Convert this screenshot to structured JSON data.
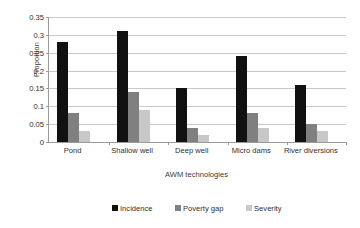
{
  "chart_data": {
    "type": "bar",
    "title": "",
    "xlabel": "AWM technologies",
    "ylabel": "Proportion",
    "categories": [
      "Pond",
      "Shallow well",
      "Deep well",
      "Micro dams",
      "River diversions"
    ],
    "series": [
      {
        "name": "Incidence",
        "color": "#111111",
        "values": [
          0.28,
          0.31,
          0.15,
          0.24,
          0.16
        ]
      },
      {
        "name": "Poverty gap",
        "color": "#808080",
        "values": [
          0.08,
          0.14,
          0.04,
          0.08,
          0.05
        ]
      },
      {
        "name": "Severity",
        "color": "#c8c8c8",
        "values": [
          0.03,
          0.09,
          0.02,
          0.04,
          0.03
        ]
      }
    ],
    "ylim": [
      0,
      0.35
    ],
    "ytick_step": 0.05,
    "yticks": [
      "0.35",
      "0.3",
      "0.25",
      "0.2",
      "0.15",
      "0.1",
      "0.05",
      "0"
    ],
    "ytick_values": [
      0.35,
      0.3,
      0.25,
      0.2,
      0.15,
      0.1,
      0.05,
      0
    ],
    "grid": true,
    "grid_axis": "y",
    "legend_position": "bottom",
    "background": "#ffffff",
    "gridline_color": "#c9c9c9",
    "axis_color": "#9a9a9a"
  }
}
